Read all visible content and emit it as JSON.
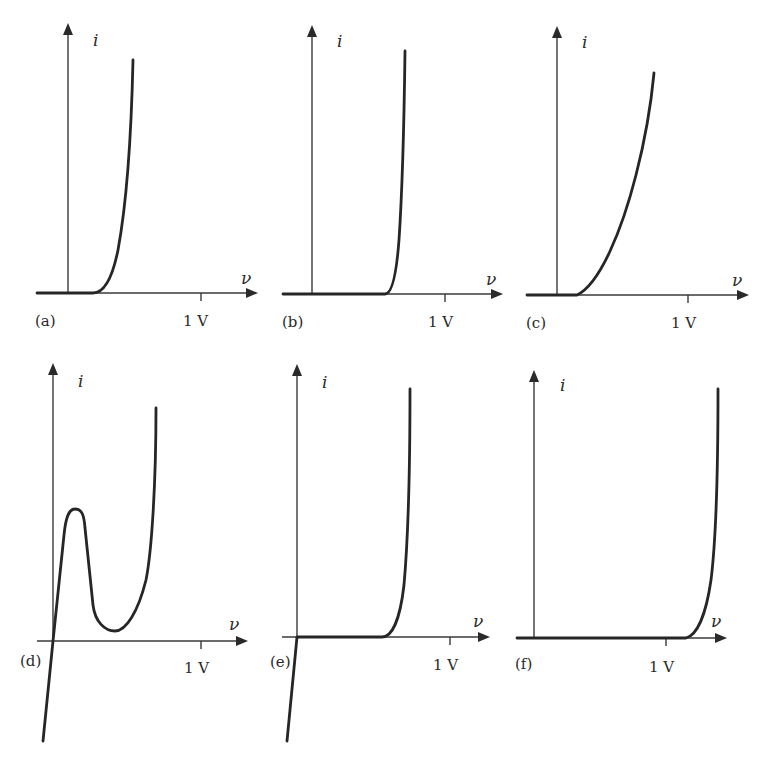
{
  "figure": {
    "axis_labels": {
      "x": "ν",
      "y": "i"
    },
    "tick_label": "1 V",
    "panels": [
      {
        "id": "a",
        "label": "(a)",
        "origin": [
          68,
          293
        ],
        "x_axis": [
          36,
          258
        ],
        "y_axis_top": 23,
        "tick_x": 201,
        "tick_label_pos": [
          183,
          326
        ],
        "panel_label_pos": [
          35,
          326
        ],
        "y_label_pos": [
          93,
          46
        ],
        "x_label_pos": [
          241,
          284
        ],
        "curve": "M37,293 L93,293 C103,293 112,280 118,250 C125,212 131,150 133,60"
      },
      {
        "id": "b",
        "label": "(b)",
        "origin": [
          312,
          294
        ],
        "x_axis": [
          282,
          503
        ],
        "y_axis_top": 25,
        "tick_x": 445,
        "tick_label_pos": [
          428,
          327
        ],
        "panel_label_pos": [
          282,
          327
        ],
        "y_label_pos": [
          337,
          47
        ],
        "x_label_pos": [
          486,
          285
        ],
        "curve": "M283,294 L385,294 C391,294 396,280 399,240 C402,195 404,130 405,51"
      },
      {
        "id": "c",
        "label": "(c)",
        "origin": [
          557,
          295
        ],
        "x_axis": [
          526,
          749
        ],
        "y_axis_top": 26,
        "tick_x": 688,
        "tick_label_pos": [
          671,
          328
        ],
        "panel_label_pos": [
          526,
          328
        ],
        "y_label_pos": [
          582,
          48
        ],
        "x_label_pos": [
          732,
          286
        ],
        "curve": "M527,295 L577,295 C600,284 622,230 636,175 C645,140 651,105 654,73"
      },
      {
        "id": "d",
        "label": "(d)",
        "origin": [
          53,
          641
        ],
        "x_axis": [
          37,
          248
        ],
        "y_axis_top": 363,
        "tick_x": 201,
        "tick_label_pos": [
          184,
          673
        ],
        "panel_label_pos": [
          20,
          666
        ],
        "y_label_pos": [
          78,
          387
        ],
        "x_label_pos": [
          229,
          630
        ],
        "curve": "M43,741 L53,641 L64,535 C66,514 70,509 75,509 C81,509 84,513 85,528 L93,605 C95,622 105,631 115,631 C126,631 138,612 146,580 C152,550 156,480 156,408"
      },
      {
        "id": "e",
        "label": "(e)",
        "origin": [
          297,
          637
        ],
        "x_axis": [
          282,
          490
        ],
        "y_axis_top": 364,
        "tick_x": 450,
        "tick_label_pos": [
          433,
          670
        ],
        "panel_label_pos": [
          270,
          667
        ],
        "y_label_pos": [
          322,
          388
        ],
        "x_label_pos": [
          473,
          627
        ],
        "curve": "M287,741 L297,637 L382,637 C392,637 400,620 404,585 C408,540 410,470 410,389"
      },
      {
        "id": "f",
        "label": "(f)",
        "origin": [
          534,
          638
        ],
        "x_axis": [
          516,
          727
        ],
        "y_axis_top": 370,
        "tick_x": 666,
        "tick_label_pos": [
          649,
          672
        ],
        "panel_label_pos": [
          515,
          669
        ],
        "y_label_pos": [
          560,
          391
        ],
        "x_label_pos": [
          711,
          627
        ],
        "curve": "M517,638 L686,638 C697,635 706,615 711,580 C716,540 718,470 718,389"
      }
    ]
  },
  "chart_data": {
    "type": "line",
    "title": "",
    "xlabel": "ν",
    "ylabel": "i",
    "tick_labels": [
      "1 V"
    ],
    "grid": false,
    "panels": [
      {
        "label": "(a)",
        "description": "exponential turn-on ~0.2 V, moderate slope",
        "knee_v": 0.2,
        "approx_points_v": [
          [
            -0.25,
            0
          ],
          [
            0,
            0
          ],
          [
            0.2,
            0
          ],
          [
            0.35,
            0.18
          ],
          [
            0.5,
            1.0
          ]
        ]
      },
      {
        "label": "(b)",
        "description": "sharp turn-on ~0.55 V",
        "knee_v": 0.55,
        "approx_points_v": [
          [
            -0.22,
            0
          ],
          [
            0,
            0
          ],
          [
            0.55,
            0
          ],
          [
            0.65,
            0.2
          ],
          [
            0.7,
            1.0
          ]
        ]
      },
      {
        "label": "(c)",
        "description": "soft turn-on ~0.15 V, gradual rise",
        "knee_v": 0.15,
        "approx_points_v": [
          [
            -0.23,
            0
          ],
          [
            0,
            0
          ],
          [
            0.15,
            0
          ],
          [
            0.6,
            0.55
          ],
          [
            0.74,
            1.0
          ]
        ]
      },
      {
        "label": "(d)",
        "description": "tunnel-diode N-shape: peak then valley, then rise; negative current for v<0",
        "approx_points_v": [
          [
            -0.07,
            -0.43
          ],
          [
            0,
            0
          ],
          [
            0.15,
            0.57
          ],
          [
            0.4,
            0.04
          ],
          [
            0.69,
            1.0
          ]
        ]
      },
      {
        "label": "(e)",
        "description": "turn-on ~0.55 V with steep reverse conduction for v<0",
        "knee_v": 0.56,
        "approx_points_v": [
          [
            -0.07,
            -0.4
          ],
          [
            0,
            0
          ],
          [
            0.56,
            0
          ],
          [
            0.68,
            0.2
          ],
          [
            0.74,
            1.0
          ]
        ]
      },
      {
        "label": "(f)",
        "description": "sharp turn-on ~1.15 V",
        "knee_v": 1.15,
        "approx_points_v": [
          [
            -0.13,
            0
          ],
          [
            0,
            0
          ],
          [
            1.15,
            0
          ],
          [
            1.33,
            0.24
          ],
          [
            1.39,
            1.0
          ]
        ]
      }
    ]
  }
}
